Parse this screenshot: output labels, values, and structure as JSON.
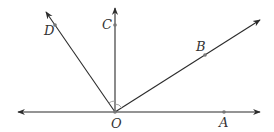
{
  "diagram": {
    "type": "geometry-rays-from-point",
    "colors": {
      "line": "#2b2b2b",
      "point": "#777777",
      "label": "#333333",
      "arc": "#9a9a9a"
    },
    "origin": {
      "name": "O",
      "x": 115,
      "y": 112,
      "label_x": 111,
      "label_y": 128
    },
    "line": {
      "name": "horizontal-line",
      "x1": 18,
      "y1": 112,
      "x2": 260,
      "y2": 112
    },
    "rays": [
      {
        "name": "OA",
        "end_x": 260,
        "end_y": 112
      },
      {
        "name": "OB",
        "end_x": 260,
        "end_y": 20
      },
      {
        "name": "OC",
        "end_x": 115,
        "end_y": 8
      },
      {
        "name": "OD",
        "end_x": 46,
        "end_y": 12
      }
    ],
    "points": [
      {
        "name": "A",
        "x": 224,
        "y": 112,
        "label_x": 219,
        "label_y": 127
      },
      {
        "name": "B",
        "x": 205,
        "y": 55,
        "label_x": 196,
        "label_y": 51
      },
      {
        "name": "C",
        "x": 115,
        "y": 25,
        "label_x": 102,
        "label_y": 29
      },
      {
        "name": "D",
        "x": 55,
        "y": 25,
        "label_x": 44,
        "label_y": 35
      }
    ],
    "labels": {
      "O": "O",
      "A": "A",
      "B": "B",
      "C": "C",
      "D": "D"
    },
    "angle_marks": [
      {
        "between": "OD-OC",
        "radius": 11
      },
      {
        "between": "OC-OB",
        "radius": 8
      }
    ]
  }
}
